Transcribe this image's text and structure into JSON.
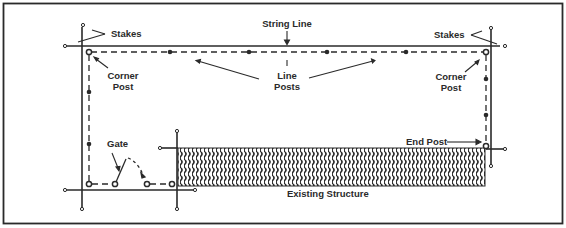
{
  "diagram": {
    "colors": {
      "ink": "#2a2a2a",
      "background": "#ffffff"
    },
    "labels": {
      "string_line": "String Line",
      "stakes_left": "Stakes",
      "stakes_right": "Stakes",
      "corner_post_left_line1": "Corner",
      "corner_post_left_line2": "Post",
      "corner_post_right_line1": "Corner",
      "corner_post_right_line2": "Post",
      "line_posts_line1": "Line",
      "line_posts_line2": "Posts",
      "end_post": "End Post",
      "gate": "Gate",
      "existing_structure": "Existing Structure"
    },
    "elements": {
      "fence_style": "dashed",
      "corner_post_symbol": "open-circle",
      "line_post_symbol": "filled-dot",
      "stake_symbol": "small-open-circle",
      "structure_fill": "wavy-hatch"
    }
  }
}
